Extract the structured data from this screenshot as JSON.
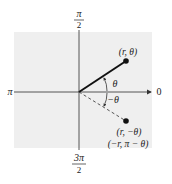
{
  "diagram": {
    "type": "polar-coordinate-symmetry",
    "background_color": "#efefef",
    "axis_labels": {
      "top": {
        "num": "π",
        "den": "2"
      },
      "bottom": {
        "num": "3π",
        "den": "2"
      },
      "left": "π",
      "right": "0"
    },
    "points": [
      {
        "id": "p1",
        "label": "(r, θ)"
      },
      {
        "id": "p2",
        "label_line1": "(r, −θ)",
        "label_line2": "(−r, π − θ)"
      }
    ],
    "angle_labels": {
      "positive": "θ",
      "negative": "−θ"
    }
  }
}
